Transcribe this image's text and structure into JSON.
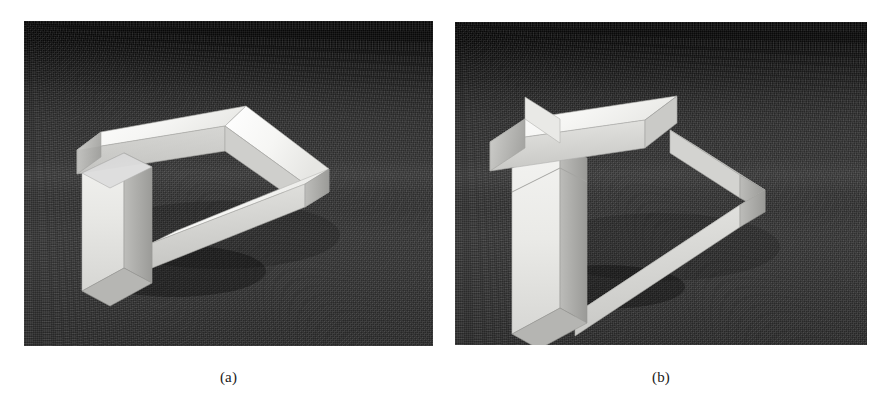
{
  "figure": {
    "background_color": "#ffffff",
    "panels": [
      {
        "id": "panel-a",
        "caption": "(a)",
        "photo": {
          "alt_name": "impossible-triangle-illusory-view",
          "backdrop_color_top": "#070707",
          "backdrop_color_bottom": "#2a2a2a",
          "object_color_top_face": "#f7f7f5",
          "object_color_left_face": "#d4d4d2",
          "object_color_right_face": "#bdbdbb",
          "object_color_shadow_face": "#9e9e9c",
          "view_note": "Viewpoint at which the white bars appear to join into a closed impossible triangle"
        },
        "frame": {
          "x": 24,
          "y": 21,
          "width": 409,
          "height": 325
        }
      },
      {
        "id": "panel-b",
        "caption": "(b)",
        "photo": {
          "alt_name": "impossible-triangle-revealed-view",
          "backdrop_color_top": "#070707",
          "backdrop_color_bottom": "#2a2a2a",
          "object_color_top_face": "#f7f7f5",
          "object_color_left_face": "#d4d4d2",
          "object_color_right_face": "#bdbdbb",
          "object_color_shadow_face": "#9e9e9c",
          "view_note": "Rotated viewpoint revealing the bars are actually disconnected, breaking the illusion"
        },
        "frame": {
          "x": 455,
          "y": 22,
          "width": 412,
          "height": 323
        }
      }
    ]
  }
}
